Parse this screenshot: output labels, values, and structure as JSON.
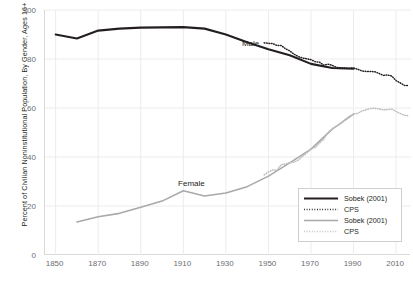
{
  "chart_data": {
    "type": "line",
    "title": "",
    "xlabel": "",
    "ylabel": "Percent of Civilian Noninstitutional Population, By Gender, Ages 16+",
    "xlim": [
      1845,
      2017
    ],
    "ylim": [
      0,
      100
    ],
    "grid": true,
    "xticks": [
      "1850",
      "1870",
      "1890",
      "1910",
      "1930",
      "1950",
      "1970",
      "1990",
      "2010"
    ],
    "xtick_values": [
      1850,
      1870,
      1890,
      1910,
      1930,
      1950,
      1970,
      1990,
      2010
    ],
    "yticks": [
      "0",
      "20",
      "40",
      "60",
      "80",
      "100"
    ],
    "ytick_values": [
      0,
      20,
      40,
      60,
      80,
      100
    ],
    "annotations": [
      {
        "text": "Male",
        "x": 1938,
        "y": 88
      },
      {
        "text": "Female",
        "x": 1908,
        "y": 31
      }
    ],
    "legend": {
      "position": "lower-right",
      "entries": [
        {
          "label": "Sobek (2001)",
          "style": "solid",
          "color": "#231f20",
          "series": "male-sobek"
        },
        {
          "label": "CPS",
          "style": "dotted",
          "color": "#231f20",
          "series": "male-cps"
        },
        {
          "label": "Sobek (2001)",
          "style": "solid",
          "color": "#a7a9ac",
          "series": "female-sobek"
        },
        {
          "label": "CPS",
          "style": "dotted",
          "color": "#bcbec0",
          "series": "female-cps"
        }
      ]
    },
    "series": [
      {
        "name": "Sobek (2001)",
        "group": "Male",
        "style": "solid",
        "color": "#231f20",
        "x": [
          1850,
          1860,
          1870,
          1880,
          1890,
          1900,
          1910,
          1920,
          1930,
          1940,
          1950,
          1960,
          1970,
          1980,
          1990
        ],
        "values": [
          90.0,
          88.4,
          91.6,
          92.4,
          92.8,
          92.9,
          93.0,
          92.4,
          90.0,
          86.8,
          84.0,
          81.5,
          78.0,
          76.3,
          76.0
        ]
      },
      {
        "name": "CPS",
        "group": "Male",
        "style": "dotted",
        "color": "#231f20",
        "x": [
          1948,
          1950,
          1952,
          1954,
          1956,
          1958,
          1960,
          1962,
          1964,
          1966,
          1968,
          1970,
          1972,
          1974,
          1976,
          1978,
          1980,
          1982,
          1984,
          1986,
          1988,
          1990,
          1992,
          1994,
          1996,
          1998,
          2000,
          2002,
          2004,
          2006,
          2008,
          2010,
          2012,
          2014,
          2016
        ],
        "values": [
          86.6,
          86.4,
          86.3,
          85.5,
          85.5,
          84.2,
          83.3,
          82.0,
          81.0,
          80.4,
          80.1,
          79.7,
          78.9,
          78.7,
          77.5,
          77.9,
          77.4,
          76.6,
          76.4,
          76.3,
          76.2,
          76.4,
          75.8,
          75.1,
          74.9,
          74.9,
          74.8,
          74.1,
          73.3,
          73.5,
          73.0,
          71.2,
          70.2,
          69.2,
          69.2
        ]
      },
      {
        "name": "Sobek (2001)",
        "group": "Female",
        "style": "solid",
        "color": "#a7a9ac",
        "x": [
          1860,
          1870,
          1880,
          1890,
          1900,
          1910,
          1920,
          1930,
          1940,
          1950,
          1960,
          1970,
          1980,
          1990
        ],
        "values": [
          13.5,
          15.6,
          17.0,
          19.5,
          22.0,
          26.2,
          24.1,
          25.3,
          27.9,
          32.2,
          37.6,
          43.2,
          51.4,
          57.5
        ]
      },
      {
        "name": "CPS",
        "group": "Female",
        "style": "dotted",
        "color": "#bcbec0",
        "x": [
          1948,
          1950,
          1952,
          1954,
          1956,
          1958,
          1960,
          1962,
          1964,
          1966,
          1968,
          1970,
          1972,
          1974,
          1976,
          1978,
          1980,
          1982,
          1984,
          1986,
          1988,
          1990,
          1992,
          1994,
          1996,
          1998,
          2000,
          2002,
          2004,
          2006,
          2008,
          2010,
          2012,
          2014,
          2016
        ],
        "values": [
          32.7,
          33.9,
          34.7,
          34.6,
          36.9,
          37.1,
          37.7,
          37.9,
          38.7,
          40.3,
          41.6,
          43.3,
          43.9,
          45.7,
          47.3,
          50.0,
          51.5,
          52.6,
          53.6,
          55.3,
          56.6,
          57.5,
          57.8,
          58.8,
          59.3,
          59.8,
          59.9,
          59.6,
          59.2,
          59.4,
          59.5,
          58.6,
          57.7,
          57.0,
          56.8
        ]
      }
    ]
  }
}
